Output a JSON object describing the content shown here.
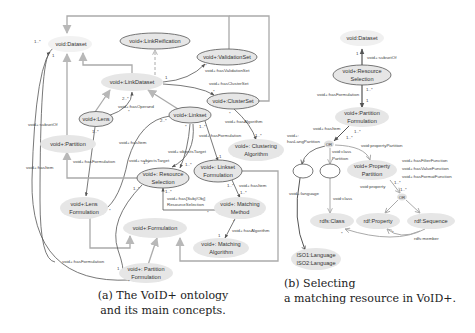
{
  "figure_a": {
    "caption_line1": "(a) The VoID+ ontology",
    "caption_line2": "and its main concepts.",
    "nodes": {
      "dataset": "void:Dataset",
      "link_reification": "void+:LinkReification",
      "validation_set": "void+:ValidationSet",
      "link_dataset": "void+:LinkDataset",
      "cluster_set": "void+:ClusterSet",
      "lens": "void+:Lens",
      "linkset": "void+:Linkset",
      "partition": "void+:Partition",
      "clustering_algorithm_1": "void+: Clustering",
      "clustering_algorithm_2": "Algorithm",
      "resource_selection_1": "void+: Resource",
      "resource_selection_2": "Selection",
      "linkset_formulation_1": "void+: Linkset",
      "linkset_formulation_2": "Formulation",
      "lens_formulation_1": "void+:Lens",
      "lens_formulation_2": "Formulation",
      "matching_method_1": "void+: Matching",
      "matching_method_2": "Method",
      "formulation": "void+:Formulation",
      "matching_algorithm_1": "void+: Matching",
      "matching_algorithm_2": "Algorithm",
      "partition_formulation_1": "void+: Partition",
      "partition_formulation_2": "Formulation"
    },
    "edge_labels": {
      "subset_of": "void+:subsetOf",
      "has_item_left": "void+:hasItem",
      "has_operand": "void+:hasOperand",
      "has_validation_set": "void+:hasValidationSet",
      "has_cluster_set": "void+:hasClusterSet",
      "has_algorithm_cluster": "void+:hasAlgorithm",
      "has_formulation_linkset": "void+:hasFormulation",
      "has_item_mid": "void+:hasItem",
      "subjects_target": "void+:subjectsTarget",
      "objects_target": "void+:objectsTarget",
      "has_formulation_lens": "void+:hasFormulation",
      "has_item_linkset": "void+:hasItem",
      "has_subjobj_1": "void+:has[Subj/Obj]",
      "has_subjobj_2": "ResourceSelection",
      "has_algorithm_matching": "void+:hasAlgorithm",
      "has_formulation_partition": "void+:hasFormulation"
    },
    "multiplicities": {
      "m_dataset_many": "1..*",
      "m_dataset_one": "1",
      "m_operand": "2..*",
      "m_operand_star": "*",
      "m_lens_1": "1..*",
      "m_linkdataset_1": "1",
      "m_validation_star": "*",
      "m_cluster_star": "*",
      "m_linkset_2": "2..*",
      "m_linkset_star": "*",
      "m_linkset_1": "1..*",
      "m_cluster_algo_star": "*",
      "m_cluster_algo_1": "1..*",
      "m_linkset_form_1": "1",
      "m_rs_1": "1..*",
      "m_rs_2": "1..*",
      "m_rs_3": "1..*",
      "m_rs_4": "1..*",
      "m_lens_form_star": "*",
      "m_mm_1": "1..*",
      "m_mm_2": "1..*",
      "m_mm_star": "*",
      "m_ma_1": "1",
      "m_pf_1": "1",
      "m_pf_star": "*",
      "m_rs_star": "*"
    }
  },
  "figure_b": {
    "caption_line1": "(b) Selecting",
    "caption_line2": "a matching resource in VoID+.",
    "nodes": {
      "dataset": "void:Dataset",
      "resource_selection_1": "void+:Resource",
      "resource_selection_2": "Selection",
      "partition_formulation_1": "void+:Partition",
      "partition_formulation_2": "Formulation",
      "or_1": "OR",
      "property_partition_1": "void+:Property",
      "property_partition_2": "Partition",
      "or_2": "OR",
      "rdfs_class": "rdfs:Class",
      "rdf_property": "rdf:Property",
      "rdf_sequence": "rdf:Sequence",
      "iso_1": "ISO1:Language",
      "iso_2": "ISO2:Language"
    },
    "edge_labels": {
      "subset_of": "void+:subsetOf",
      "has_formulation": "void+:hasFormulation",
      "has_item": "void+:hasItem",
      "has_lang_partition_1": "void+:",
      "has_lang_partition_2": "hasLangPartition",
      "class_partition_1": "void:class",
      "class_partition_2": "Partition",
      "property_partition": "void:propertyPartition",
      "has_filter_function": "void+:hasFilterFunction",
      "has_value_function": "void+:hasValueFunction",
      "has_format_function": "void+:hasFormatFunction",
      "language": "void+:language",
      "void_class": "void:class",
      "void_property": "void:property",
      "rdfs_member": "rdfs:member"
    },
    "multiplicities": {
      "m_1": "1",
      "m_many": "1..*",
      "m_pf_1": "1",
      "m_or_1": "1..*",
      "m_or_2": "1..*",
      "m_pp_1": "1..*",
      "m_pp_2": "1..*",
      "m_star_1": "*",
      "m_star_2": "*"
    }
  },
  "colors": {
    "node_fill": "#e6e6e6",
    "node_stroke": "#555555",
    "edge_dark": "#555555",
    "edge_light": "#aaaaaa",
    "text": "#333333"
  }
}
